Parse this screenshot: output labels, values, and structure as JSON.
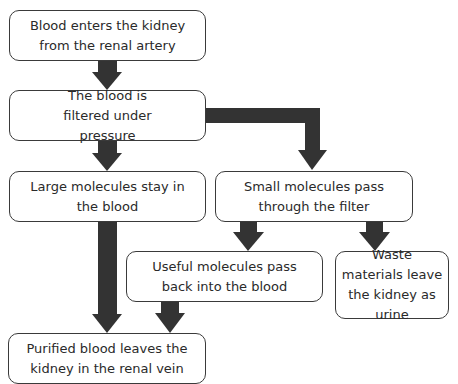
{
  "diagram": {
    "type": "flowchart",
    "nodes": [
      {
        "id": "n1",
        "text": "Blood enters the kidney from the renal artery"
      },
      {
        "id": "n2",
        "text": "The blood is filtered under pressure"
      },
      {
        "id": "n3",
        "text": "Large molecules stay in the blood"
      },
      {
        "id": "n4",
        "text": "Small molecules pass through the filter"
      },
      {
        "id": "n5",
        "text": "Useful molecules pass back into the blood"
      },
      {
        "id": "n6",
        "text": "Waste materials leave the kidney as urine"
      },
      {
        "id": "n7",
        "text": "Purified blood leaves the kidney in the renal vein"
      }
    ],
    "edges": [
      {
        "from": "n1",
        "to": "n2"
      },
      {
        "from": "n2",
        "to": "n3"
      },
      {
        "from": "n2",
        "to": "n4"
      },
      {
        "from": "n4",
        "to": "n5"
      },
      {
        "from": "n4",
        "to": "n6"
      },
      {
        "from": "n3",
        "to": "n7"
      },
      {
        "from": "n5",
        "to": "n7"
      }
    ],
    "colors": {
      "arrow": "#333333",
      "border": "#3a3a3a",
      "background": "#ffffff"
    }
  }
}
